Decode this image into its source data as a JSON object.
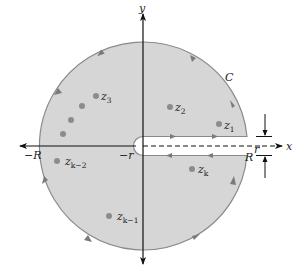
{
  "diagram": {
    "type": "keyhole-contour",
    "colors": {
      "region_fill": "#d6d6d6",
      "contour_stroke": "#8a8a8a",
      "axis": "#111111",
      "point": "#8c8c8c",
      "arrowhead": "#7a7a7a",
      "background": "#ffffff"
    },
    "axes": {
      "x_label": "x",
      "y_label": "y"
    },
    "contour_label": "C",
    "radius_labels": {
      "big_neg": "−R",
      "big_pos": "R",
      "small_neg": "−r",
      "small_gap": "r"
    },
    "points": [
      {
        "base": "z",
        "sub": "1"
      },
      {
        "base": "z",
        "sub": "2"
      },
      {
        "base": "z",
        "sub": "3"
      },
      {
        "base": "z",
        "sub": "k−2"
      },
      {
        "base": "z",
        "sub": "k−1"
      },
      {
        "base": "z",
        "sub": "k"
      }
    ]
  }
}
